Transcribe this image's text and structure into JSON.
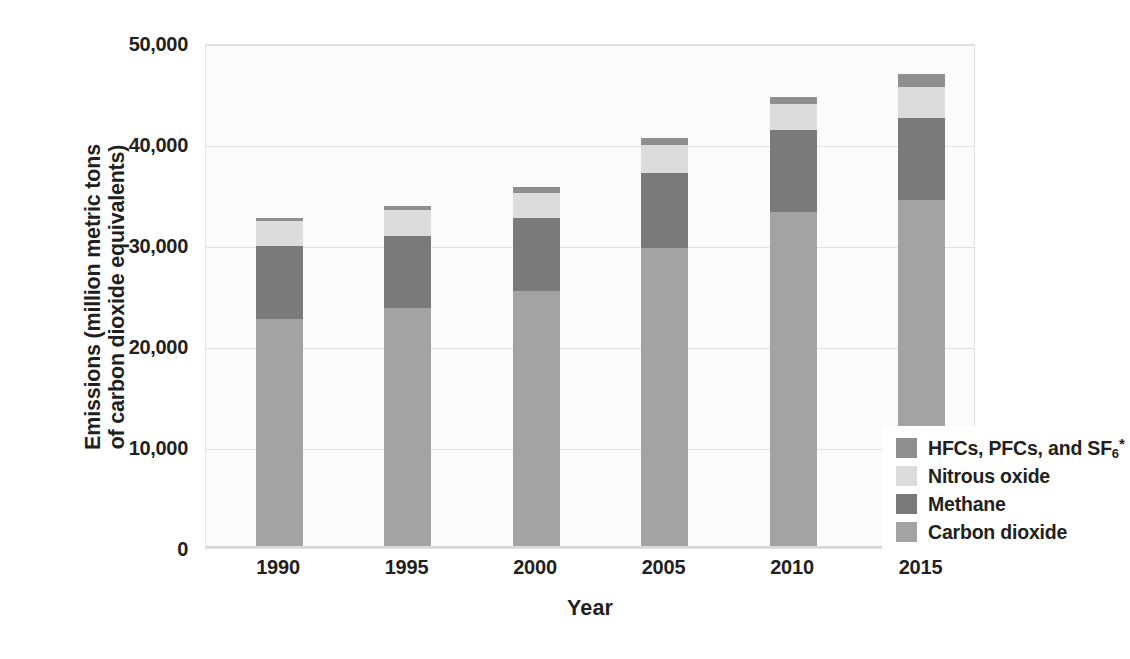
{
  "chart_data": {
    "type": "bar",
    "stacked": true,
    "title": "",
    "xlabel": "Year",
    "ylabel_line1": "Emissions (million metric tons",
    "ylabel_line2": "of carbon dioxide equivalents)",
    "categories": [
      "1990",
      "1995",
      "2000",
      "2005",
      "2010",
      "2015"
    ],
    "ylim": [
      0,
      50000
    ],
    "yticks": [
      0,
      10000,
      20000,
      30000,
      40000,
      50000
    ],
    "ytick_labels": [
      "0",
      "10,000",
      "20,000",
      "30,000",
      "40,000",
      "50,000"
    ],
    "grid": true,
    "legend_position": "inside-lower-right",
    "series": [
      {
        "name": "Carbon dioxide",
        "color": "#a3a3a3",
        "values": [
          22700,
          23800,
          25400,
          29700,
          33300,
          34500
        ]
      },
      {
        "name": "Methane",
        "color": "#7a7a7a",
        "values": [
          7200,
          7100,
          7300,
          7400,
          8100,
          8100
        ]
      },
      {
        "name": "Nitrous oxide",
        "color": "#dcdcdc",
        "values": [
          2500,
          2600,
          2500,
          2800,
          2600,
          3000
        ]
      },
      {
        "name": "HFCs, PFCs, and SF6*",
        "color": "#8f8f8f",
        "values": [
          300,
          400,
          500,
          700,
          700,
          1300
        ]
      }
    ],
    "totals": [
      32700,
      33900,
      35700,
      40600,
      44700,
      46900
    ]
  },
  "legend": {
    "items": [
      {
        "label_html": "HFCs, PFCs, and SF<sub>6</sub><sup>*</sup>",
        "label_text": "HFCs, PFCs, and SF6*",
        "color": "#8f8f8f"
      },
      {
        "label_html": "Nitrous oxide",
        "label_text": "Nitrous oxide",
        "color": "#dcdcdc"
      },
      {
        "label_html": "Methane",
        "label_text": "Methane",
        "color": "#7a7a7a"
      },
      {
        "label_html": "Carbon dioxide",
        "label_text": "Carbon dioxide",
        "color": "#a3a3a3"
      }
    ]
  },
  "colors": {
    "plot_background": "#fbfbfb",
    "gridline": "#e0e0e0",
    "text": "#231f20"
  }
}
